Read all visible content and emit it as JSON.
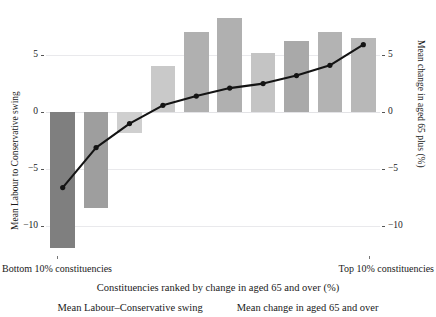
{
  "chart_data": {
    "type": "bar",
    "title": "",
    "xlabel": "Constituencies ranked by change in aged 65 and over (%)",
    "ylabel": "Mean Labour to Conservative swing",
    "y2label": "Mean change in aged 65 plus (%)",
    "ylim": [
      -12.5,
      8.5
    ],
    "y2lim": [
      -12.5,
      8.5
    ],
    "yticks": [
      "5",
      "0",
      "-5",
      "-10"
    ],
    "ytick_values": [
      5,
      0,
      -5,
      -10
    ],
    "y2ticks": [
      "5",
      "0",
      "-5",
      "-10"
    ],
    "y2tick_values": [
      5,
      0,
      -5,
      -10
    ],
    "grid": true,
    "legend_position": "bottom",
    "x_axis_left_label": "Bottom 10% constituencies",
    "x_axis_right_label": "Top 10% constituencies",
    "categories": [
      "1",
      "2",
      "3",
      "4",
      "5",
      "6",
      "7",
      "8",
      "9",
      "10"
    ],
    "series": [
      {
        "name": "Mean Labour–Conservative swing",
        "type": "bar",
        "axis": "left",
        "values": [
          -11.9,
          -8.4,
          -1.8,
          4.0,
          7.0,
          8.2,
          5.2,
          6.2,
          7.0,
          6.5
        ],
        "colors": [
          "#7f7f7f",
          "#9e9e9e",
          "#cfcfcf",
          "#c9c9c9",
          "#b0b0b0",
          "#b0b0b0",
          "#c4c4c4",
          "#a9a9a9",
          "#b3b3b3",
          "#b8b8b8"
        ]
      },
      {
        "name": "Mean change in aged 65 and over",
        "type": "line",
        "axis": "right",
        "marker": "circle",
        "color": "#141414",
        "values": [
          -6.6,
          -3.1,
          -1.0,
          0.6,
          1.4,
          2.1,
          2.5,
          3.2,
          4.1,
          5.9
        ]
      }
    ]
  },
  "axes": {
    "left_title": "Mean Labour to Conservative swing",
    "right_title": "Mean change in aged 65 plus (%)",
    "bottom_title": "Constituencies ranked by change in aged 65 and over (%)",
    "left_ticks": [
      "5",
      "0",
      "-5",
      "-10"
    ],
    "right_ticks": [
      "5",
      "0",
      "-5",
      "-10"
    ],
    "x_left_category": "Bottom 10% constituencies",
    "x_right_category": "Top 10% constituencies"
  },
  "legend": {
    "items": [
      {
        "label": "Mean Labour–Conservative swing"
      },
      {
        "label": "Mean change in aged 65 and over"
      }
    ]
  },
  "header": {
    "cropped_text": ""
  }
}
